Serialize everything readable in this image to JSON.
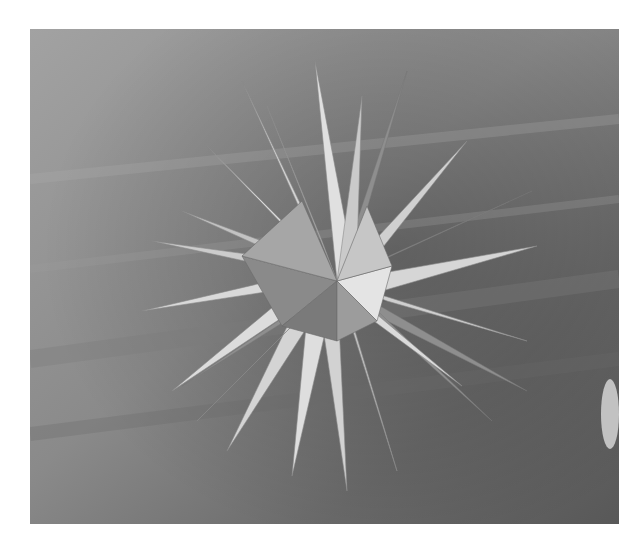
{
  "image": {
    "alt": "Grayscale photograph of a many-pointed paper star sculpture resting on a wooden table",
    "subject": "paper-star-sculpture",
    "background": "wood-grain-table",
    "colors": {
      "page": "#ffffff",
      "wood_light": "#9a9a9a",
      "wood_dark": "#5e5e5e",
      "paper_light": "#dcdcdc",
      "paper_mid": "#b4b4b4",
      "paper_shadow": "#7a7a7a"
    }
  }
}
